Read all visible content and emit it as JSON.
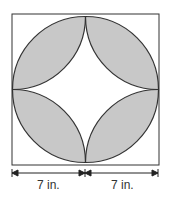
{
  "diagram": {
    "shade_color": "#c8c8c8",
    "line_color": "#333333",
    "dimensions": [
      {
        "label": "7 in."
      },
      {
        "label": "7 in."
      }
    ]
  }
}
